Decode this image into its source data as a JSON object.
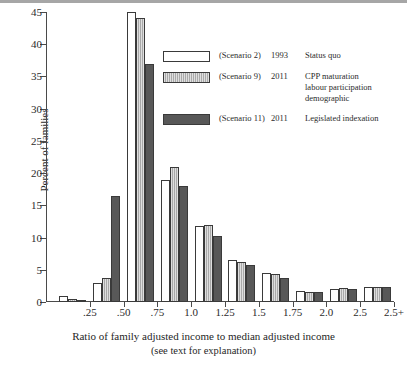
{
  "chart_data": {
    "type": "bar",
    "title": "",
    "xlabel": "Ratio of family adjusted income to median adjusted income",
    "xlabel_sub": "(see text for explanation)",
    "ylabel": "Percent of families",
    "ylim": [
      0,
      45
    ],
    "ytick_values": [
      0,
      5,
      10,
      15,
      20,
      25,
      30,
      35,
      40,
      45
    ],
    "ytick_labels": [
      "0",
      "5",
      "10",
      "15",
      "20",
      "25",
      "30",
      "35",
      "40",
      "45"
    ],
    "xtick_labels": [
      ".25",
      ".50",
      ".75",
      "1.0",
      "1.25",
      "1.5",
      "1.75",
      "2.0",
      "2.5",
      "2.5+"
    ],
    "grid": false,
    "legend_position": "upper-right-inset",
    "categories": [
      "0-.25",
      ".25-.50",
      ".50-.75",
      ".75-1.0",
      "1.0-1.25",
      "1.25-1.5",
      "1.5-1.75",
      "1.75-2.0",
      "2.0-2.5",
      "2.5+"
    ],
    "series": [
      {
        "name": "Status quo",
        "scenario": "(Scenario 2)",
        "year": "1993",
        "fill": "white",
        "color": "#ffffff",
        "values": [
          1.0,
          3.0,
          45.0,
          19.0,
          11.8,
          6.5,
          4.5,
          1.7,
          2.0,
          2.3
        ]
      },
      {
        "name": "CPP maturation labour participation demographic",
        "scenario": "(Scenario 9)",
        "year": "2011",
        "fill": "light-gray-stipple",
        "color": "#b9b9b9",
        "values": [
          0.5,
          3.8,
          44.0,
          21.0,
          12.0,
          6.2,
          4.3,
          1.5,
          2.2,
          2.4
        ]
      },
      {
        "name": "Legislated indexation",
        "scenario": "(Scenario 11)",
        "year": "2011",
        "fill": "dark-gray-solid",
        "color": "#585858",
        "values": [
          0.3,
          16.5,
          37.0,
          18.0,
          10.3,
          5.8,
          3.8,
          1.6,
          2.0,
          2.3
        ]
      }
    ]
  },
  "legend": {
    "rows": [
      {
        "scenario": "(Scenario 2)",
        "year": "1993",
        "desc_line1": "Status quo",
        "desc_line2": "",
        "desc_line3": ""
      },
      {
        "scenario": "(Scenario 9)",
        "year": "2011",
        "desc_line1": "CPP maturation",
        "desc_line2": "labour participation",
        "desc_line3": "demographic"
      },
      {
        "scenario": "(Scenario 11)",
        "year": "2011",
        "desc_line1": "Legislated indexation",
        "desc_line2": "",
        "desc_line3": ""
      }
    ]
  },
  "axes": {
    "x_title": "Ratio of family adjusted income to median adjusted income",
    "x_subtitle": "(see text for explanation)",
    "y_title": "Percent of families"
  }
}
